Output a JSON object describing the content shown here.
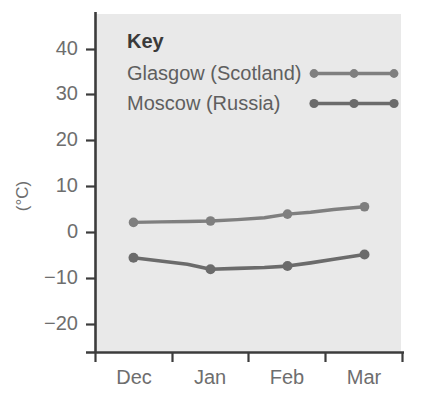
{
  "chart_data": {
    "type": "line",
    "title": "",
    "subtitle": "",
    "xlabel": "",
    "ylabel": "(°C)",
    "categories": [
      "Dec",
      "Jan",
      "Feb",
      "Mar"
    ],
    "x_tick_labels": [
      "Dec",
      "Jan",
      "Feb",
      "Mar"
    ],
    "y_tick_labels": [
      "40",
      "30",
      "20",
      "10",
      "0",
      "−10",
      "−20"
    ],
    "y_ticks": [
      40,
      30,
      20,
      10,
      0,
      -10,
      -20
    ],
    "ylim": [
      -26,
      45
    ],
    "grid": false,
    "legend_position": "inside-top-left",
    "legend_title": "Key",
    "series": [
      {
        "name": "Glasgow (Scotland)",
        "color": "#7f7f7f",
        "values": [
          2.2,
          2.5,
          4.0,
          5.6
        ],
        "detail_x": [
          0,
          0.35,
          0.7,
          1.0,
          1.35,
          1.7,
          2.0,
          2.3,
          2.6,
          3.0
        ],
        "detail_y": [
          2.2,
          2.3,
          2.4,
          2.5,
          2.8,
          3.2,
          4.0,
          4.4,
          5.0,
          5.6
        ]
      },
      {
        "name": "Moscow (Russia)",
        "color": "#6b6b6b",
        "values": [
          -5.5,
          -8.0,
          -7.3,
          -4.8
        ],
        "detail_x": [
          0,
          0.35,
          0.7,
          1.0,
          1.35,
          1.7,
          2.0,
          2.3,
          2.6,
          3.0
        ],
        "detail_y": [
          -5.5,
          -6.2,
          -6.9,
          -8.0,
          -7.8,
          -7.6,
          -7.3,
          -6.6,
          -5.8,
          -4.8
        ]
      }
    ]
  },
  "legend": {
    "title": "Key",
    "entries": [
      {
        "label": "Glasgow (Scotland)",
        "color": "#7f7f7f"
      },
      {
        "label": "Moscow (Russia)",
        "color": "#6b6b6b"
      }
    ]
  },
  "axes": {
    "y_title": "(°C)",
    "y_tick_labels": [
      "40",
      "30",
      "20",
      "10",
      "0",
      "−10",
      "−20"
    ],
    "x_tick_labels": [
      "Dec",
      "Jan",
      "Feb",
      "Mar"
    ]
  },
  "style": {
    "panel_background": "#e9e9e9",
    "page_background": "#ffffff",
    "axis_color": "#3c3c3c",
    "tick_text_color": "#6e6e6e"
  }
}
